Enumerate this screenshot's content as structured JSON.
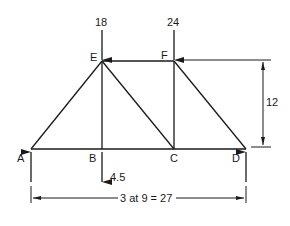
{
  "diagram": {
    "type": "truss",
    "nodes": [
      {
        "id": "A",
        "label": "A"
      },
      {
        "id": "B",
        "label": "B"
      },
      {
        "id": "C",
        "label": "C"
      },
      {
        "id": "D",
        "label": "D"
      },
      {
        "id": "E",
        "label": "E"
      },
      {
        "id": "F",
        "label": "F"
      }
    ],
    "members": [
      "AB",
      "BC",
      "CD",
      "EF",
      "AE",
      "BE",
      "CE",
      "CF",
      "DF"
    ],
    "loads": [
      {
        "node": "E",
        "value": "18",
        "direction": "down"
      },
      {
        "node": "F",
        "value": "24",
        "direction": "down"
      },
      {
        "node": "B",
        "value": "4.5",
        "direction": "down"
      }
    ],
    "reactions": [
      {
        "node": "A",
        "direction": "up"
      },
      {
        "node": "D",
        "direction": "up"
      }
    ],
    "dimensions": {
      "height": "12",
      "span": "3 at 9 = 27"
    },
    "stroke_color": "#1a1a1a"
  }
}
